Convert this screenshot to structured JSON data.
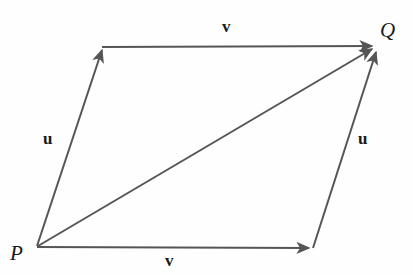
{
  "figure": {
    "type": "vector-parallelogram-diagram",
    "background_color": "#fefefe",
    "stroke_color": "#555555",
    "label_color": "#1a1a1a",
    "stroke_width": 2,
    "width": 413,
    "height": 275,
    "points": {
      "P": {
        "label": "P",
        "x": 37,
        "y": 246
      },
      "Q": {
        "label": "Q",
        "x": 377,
        "y": 46
      },
      "top_left": {
        "x": 102,
        "y": 47
      },
      "bottom_right": {
        "x": 313,
        "y": 248
      }
    },
    "vectors": [
      {
        "name": "u-left",
        "label": "u",
        "from": "P",
        "to": "top_left",
        "arrowhead": "end",
        "label_x": 43,
        "label_y": 130
      },
      {
        "name": "v-top",
        "label": "v",
        "from": "top_left",
        "to": "Q",
        "arrowhead": "end",
        "label_x": 222,
        "label_y": 18
      },
      {
        "name": "v-bottom",
        "label": "v",
        "from": "P",
        "to": "bottom_right",
        "arrowhead": "end",
        "label_x": 165,
        "label_y": 252
      },
      {
        "name": "u-right",
        "label": "u",
        "from": "bottom_right",
        "to": "Q",
        "arrowhead": "end",
        "label_x": 358,
        "label_y": 130
      },
      {
        "name": "resultant-diagonal",
        "label": "",
        "from": "P",
        "to": "Q",
        "arrowhead": "end",
        "label_x": null,
        "label_y": null
      }
    ]
  }
}
